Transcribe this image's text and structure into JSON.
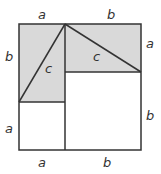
{
  "diagram": {
    "colors": {
      "shade": "#d9d9d9",
      "stroke": "#333333",
      "background": "#ffffff"
    },
    "labels": {
      "top_a": "a",
      "top_b": "b",
      "left_b": "b",
      "left_a": "a",
      "right_a": "a",
      "right_b": "b",
      "bottom_a": "a",
      "bottom_b": "b",
      "hyp_left": "c",
      "hyp_right": "c"
    }
  }
}
